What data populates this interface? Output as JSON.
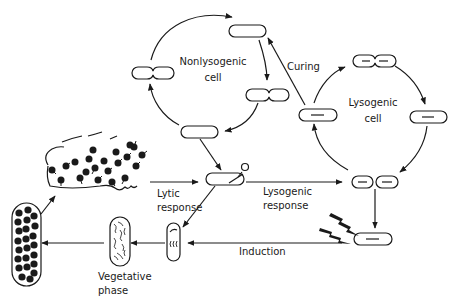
{
  "diagram": {
    "colors": {
      "ink": "#1a1a1a",
      "background": "#ffffff"
    },
    "labels": {
      "nonlysogenic": [
        "Nonlysogenic",
        "cell"
      ],
      "lysogenic": [
        "Lysogenic",
        "cell"
      ],
      "curing": "Curing",
      "lytic_response": [
        "Lytic",
        "response"
      ],
      "lysogenic_response": [
        "Lysogenic",
        "response"
      ],
      "induction": "Induction",
      "vegetative_phase": [
        "Vegetative",
        "phase"
      ]
    },
    "nodes": [
      {
        "id": "nonlyso-top",
        "type": "cell"
      },
      {
        "id": "nonlyso-right-dividing",
        "type": "dividing-cell"
      },
      {
        "id": "nonlyso-bottom",
        "type": "cell"
      },
      {
        "id": "nonlyso-left-dividing",
        "type": "dividing-cell"
      },
      {
        "id": "infected-cell",
        "type": "cell-with-phage"
      },
      {
        "id": "lyso-left",
        "type": "lysogen"
      },
      {
        "id": "lyso-top-dividing",
        "type": "dividing-lysogen"
      },
      {
        "id": "lyso-right",
        "type": "lysogen"
      },
      {
        "id": "lyso-bottom-pair",
        "type": "lysogen-pair"
      },
      {
        "id": "induced-lysogen",
        "type": "lysogen"
      },
      {
        "id": "early-lytic-cell",
        "type": "small-cell"
      },
      {
        "id": "vegetative-cell",
        "type": "cell-with-dna"
      },
      {
        "id": "burst-cell",
        "type": "cell-full-of-phages"
      },
      {
        "id": "released-phages",
        "type": "lysate"
      },
      {
        "id": "uv-lightning",
        "type": "inducing-agent"
      }
    ]
  }
}
